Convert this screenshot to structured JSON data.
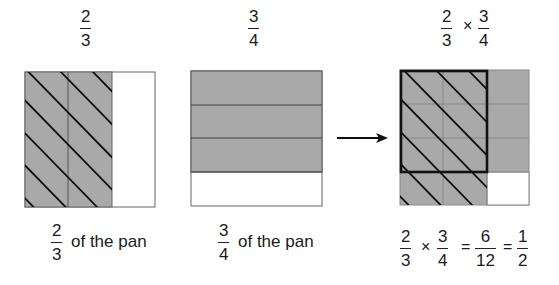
{
  "panels": [
    {
      "title": {
        "num": "2",
        "den": "3"
      },
      "caption": {
        "num": "2",
        "den": "3",
        "text": "of the pan"
      }
    },
    {
      "title": {
        "num": "3",
        "den": "4"
      },
      "caption": {
        "num": "3",
        "den": "4",
        "text": "of the pan"
      }
    },
    {
      "title": {
        "a_num": "2",
        "a_den": "3",
        "op": "×",
        "b_num": "3",
        "b_den": "4"
      },
      "equation": {
        "a_num": "2",
        "a_den": "3",
        "op1": "×",
        "b_num": "3",
        "b_den": "4",
        "eq1": "=",
        "c_num": "6",
        "c_den": "12",
        "eq2": "=",
        "d_num": "1",
        "d_den": "2"
      }
    }
  ],
  "colors": {
    "shade": "#a9a9a9",
    "line": "#111111",
    "grid": "#555555",
    "white": "#ffffff"
  }
}
